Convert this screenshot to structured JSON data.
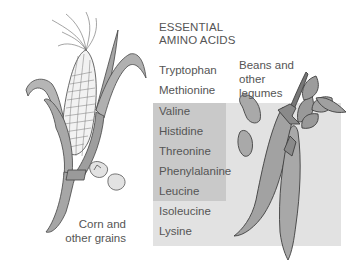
{
  "title": {
    "line1": "ESSENTIAL",
    "line2": "AMINO ACIDS"
  },
  "amino_acids": [
    {
      "name": "Tryptophan",
      "group": "corn"
    },
    {
      "name": "Methionine",
      "group": "corn"
    },
    {
      "name": "Valine",
      "group": "both"
    },
    {
      "name": "Histidine",
      "group": "both"
    },
    {
      "name": "Threonine",
      "group": "both"
    },
    {
      "name": "Phenylalanine",
      "group": "both"
    },
    {
      "name": "Leucine",
      "group": "both"
    },
    {
      "name": "Isoleucine",
      "group": "legumes"
    },
    {
      "name": "Lysine",
      "group": "legumes"
    }
  ],
  "labels": {
    "legumes_line1": "Beans and",
    "legumes_line2": "other",
    "legumes_line3": "legumes",
    "grains_line1": "Corn and",
    "grains_line2": "other grains"
  },
  "colors": {
    "light_box": "#e2e2e2",
    "dark_box": "#c9c9c9",
    "text": "#555555",
    "illustration_fill": "#a8a8a8",
    "outline": "#444444"
  }
}
